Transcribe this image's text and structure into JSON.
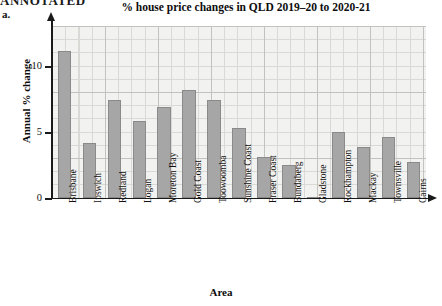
{
  "page": {
    "cutoff_banner_text": "ANNOTATED",
    "exercise_label": "a."
  },
  "chart_data": {
    "type": "bar",
    "title": "% house price changes in QLD 2019–20 to 2020-21",
    "xlabel": "Area",
    "ylabel": "Annual % change",
    "ylim": [
      0,
      12.5
    ],
    "yticks": [
      0,
      5,
      10
    ],
    "ytick_labels": [
      "0",
      "5",
      "10"
    ],
    "grid": true,
    "legend": "none",
    "bar_color": "#a6a6a6",
    "bar_edge_color": "#8a8a8a",
    "categories": [
      "Brisbane",
      "Ipswich",
      "Redland",
      "Logan",
      "Moreton Bay",
      "Gold Coast",
      "Toowoomba",
      "Sunshine Coast",
      "Fraser Coast",
      "Bundaberg",
      "Gladstone",
      "Rockhampton",
      "Mackay",
      "Townsville",
      "Cairns"
    ],
    "values": [
      11.1,
      4.2,
      7.4,
      5.8,
      6.9,
      8.2,
      7.4,
      5.3,
      3.1,
      2.5,
      0.1,
      5.0,
      3.9,
      4.6,
      2.7
    ]
  }
}
